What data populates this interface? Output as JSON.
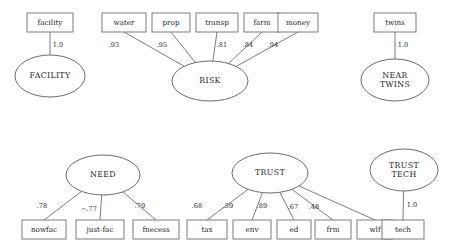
{
  "figure": {
    "type": "sem-path-diagram",
    "background_color": "#ffffff",
    "line_color": "#6e6e6e",
    "text_color": "#1a1a1a"
  },
  "groups": [
    {
      "id": "facility",
      "factor": {
        "label": "FACILITY",
        "lines": [
          "FACILITY"
        ],
        "cx": 50,
        "cy": 76,
        "rx": 35,
        "ry": 21
      },
      "indicators": [
        {
          "label": "facility",
          "x": 27,
          "y": 13,
          "w": 46,
          "h": 19,
          "coef": "1.0",
          "coef_x": 58,
          "coef_y": 45
        }
      ]
    },
    {
      "id": "risk",
      "factor": {
        "label": "RISK",
        "lines": [
          "RISK"
        ],
        "cx": 210,
        "cy": 81,
        "rx": 38,
        "ry": 20
      },
      "indicators": [
        {
          "label": "water",
          "x": 102,
          "y": 13,
          "w": 44,
          "h": 19,
          "coef": ".93",
          "coef_x": 114,
          "coef_y": 45
        },
        {
          "label": "prop",
          "x": 152,
          "y": 13,
          "w": 38,
          "h": 19,
          "coef": ".95",
          "coef_x": 162,
          "coef_y": 45
        },
        {
          "label": "transp",
          "x": 196,
          "y": 13,
          "w": 42,
          "h": 19,
          "coef": ".81",
          "coef_x": 222,
          "coef_y": 45
        },
        {
          "label": "farm",
          "x": 244,
          "y": 13,
          "w": 36,
          "h": 19,
          "coef": ".84",
          "coef_x": 248,
          "coef_y": 45
        },
        {
          "label": "money",
          "x": 278,
          "y": 13,
          "w": 40,
          "h": 19,
          "coef": ".94",
          "coef_x": 273,
          "coef_y": 45
        }
      ]
    },
    {
      "id": "near-twins",
      "factor": {
        "label": "NEAR TWINS",
        "lines": [
          "NEAR",
          "TWINS"
        ],
        "cx": 395,
        "cy": 80,
        "rx": 34,
        "ry": 21
      },
      "indicators": [
        {
          "label": "twins",
          "x": 374,
          "y": 13,
          "w": 42,
          "h": 19,
          "coef": "1.0",
          "coef_x": 403,
          "coef_y": 45
        }
      ]
    },
    {
      "id": "need",
      "factor": {
        "label": "NEED",
        "lines": [
          "NEED"
        ],
        "cx": 103,
        "cy": 175,
        "rx": 37,
        "ry": 20
      },
      "indicators": [
        {
          "label": "nowfac",
          "x": 22,
          "y": 220,
          "w": 44,
          "h": 19,
          "coef": ".78",
          "coef_x": 42,
          "coef_y": 206
        },
        {
          "label": "just-fac",
          "x": 76,
          "y": 220,
          "w": 48,
          "h": 19,
          "coef": "−.77",
          "coef_x": 89,
          "coef_y": 209
        },
        {
          "label": "fnecess",
          "x": 133,
          "y": 220,
          "w": 46,
          "h": 19,
          "coef": ".79",
          "coef_x": 140,
          "coef_y": 206
        }
      ]
    },
    {
      "id": "trust",
      "factor": {
        "label": "TRUST",
        "lines": [
          "TRUST"
        ],
        "cx": 270,
        "cy": 173,
        "rx": 38,
        "ry": 20
      },
      "indicators": [
        {
          "label": "tax",
          "x": 187,
          "y": 220,
          "w": 40,
          "h": 19,
          "coef": ".68",
          "coef_x": 197,
          "coef_y": 206
        },
        {
          "label": "env",
          "x": 233,
          "y": 220,
          "w": 38,
          "h": 19,
          "coef": ".59",
          "coef_x": 228,
          "coef_y": 206
        },
        {
          "label": "ed",
          "x": 277,
          "y": 220,
          "w": 34,
          "h": 19,
          "coef": ".89",
          "coef_x": 262,
          "coef_y": 206
        },
        {
          "label": "frm",
          "x": 315,
          "y": 220,
          "w": 36,
          "h": 19,
          "coef": ".67",
          "coef_x": 293,
          "coef_y": 207
        },
        {
          "label": "wlf",
          "x": 357,
          "y": 220,
          "w": 36,
          "h": 19,
          "coef": ".48",
          "coef_x": 314,
          "coef_y": 207
        }
      ]
    },
    {
      "id": "trust-tech",
      "factor": {
        "label": "TRUST TECH",
        "lines": [
          "TRUST",
          "TECH"
        ],
        "cx": 404,
        "cy": 170,
        "rx": 34,
        "ry": 21
      },
      "indicators": [
        {
          "label": "tech",
          "x": 382,
          "y": 220,
          "w": 42,
          "h": 19,
          "coef": "1.0",
          "coef_x": 412,
          "coef_y": 205
        }
      ]
    }
  ]
}
